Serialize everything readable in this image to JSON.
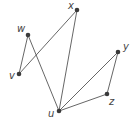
{
  "graph": {
    "nodes": [
      {
        "id": "x",
        "label": "x",
        "cx": 77,
        "cy": 10,
        "lx": 68,
        "ly": 9
      },
      {
        "id": "w",
        "label": "w",
        "cx": 28,
        "cy": 35,
        "lx": 17,
        "ly": 32
      },
      {
        "id": "v",
        "label": "v",
        "cx": 19,
        "cy": 74,
        "lx": 9,
        "ly": 79
      },
      {
        "id": "u",
        "label": "u",
        "cx": 59,
        "cy": 111,
        "lx": 48,
        "ly": 117
      },
      {
        "id": "z",
        "label": "z",
        "cx": 107,
        "cy": 94,
        "lx": 109,
        "ly": 105
      },
      {
        "id": "y",
        "label": "y",
        "cx": 118,
        "cy": 52,
        "lx": 123,
        "ly": 50
      }
    ],
    "edges": [
      [
        "x",
        "v"
      ],
      [
        "x",
        "u"
      ],
      [
        "w",
        "v"
      ],
      [
        "w",
        "u"
      ],
      [
        "u",
        "y"
      ],
      [
        "u",
        "z"
      ],
      [
        "y",
        "z"
      ]
    ]
  }
}
